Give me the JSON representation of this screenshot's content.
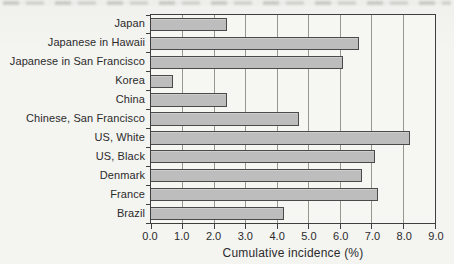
{
  "page": {
    "background_color": "#f4f4f1"
  },
  "chart_data": {
    "type": "bar",
    "orientation": "horizontal",
    "title": "",
    "xlabel": "Cumulative incidence (%)",
    "ylabel": "",
    "xlim": [
      0.0,
      9.0
    ],
    "grid": true,
    "legend": false,
    "categories": [
      "Japan",
      "Japanese in Hawaii",
      "Japanese in San Francisco",
      "Korea",
      "China",
      "Chinese, San Francisco",
      "US, White",
      "US, Black",
      "Denmark",
      "France",
      "Brazil"
    ],
    "values": [
      2.4,
      6.6,
      6.1,
      0.7,
      2.4,
      4.7,
      8.2,
      7.1,
      6.7,
      7.2,
      4.2
    ],
    "xtick_labels": [
      "0.0",
      "1.0",
      "2.0",
      "3.0",
      "4.0",
      "5.0",
      "6.0",
      "7.0",
      "8.0",
      "9.0"
    ],
    "colors": {
      "bar_fill": "#bdbdbd",
      "bar_border": "#4a4a4a",
      "gridline": "#97978f",
      "axis": "#3f3f3f",
      "text": "#2b2b2b"
    }
  }
}
